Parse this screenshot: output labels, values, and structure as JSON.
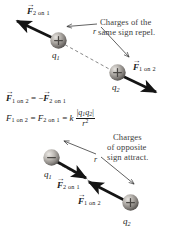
{
  "figure": {
    "background_color": "#ffffff",
    "width": 180,
    "height": 242
  },
  "panels": [
    {
      "id": "repulsion",
      "caption_lines": [
        "Charges of the",
        "same sign repel."
      ],
      "charge_labels": {
        "q1": "q",
        "q1_sub": "1",
        "q2": "q",
        "q2_sub": "2"
      },
      "charge_signs": {
        "q1": "+",
        "q2": "+"
      },
      "distance_label": "r",
      "force_on_1": {
        "symbol": "F",
        "subscript": "2 on 1"
      },
      "force_on_2": {
        "symbol": "F",
        "subscript": "1 on 2"
      }
    },
    {
      "id": "attraction",
      "caption_lines": [
        "Charges",
        "of opposite",
        "sign attract."
      ],
      "charge_labels": {
        "q1": "q",
        "q1_sub": "1",
        "q2": "q",
        "q2_sub": "2"
      },
      "charge_signs": {
        "q1": "−",
        "q2": "+"
      },
      "distance_label": "r",
      "force_on_1": {
        "symbol": "F",
        "subscript": "2 on 1"
      },
      "force_on_2": {
        "symbol": "F",
        "subscript": "1 on 2"
      }
    }
  ],
  "equations": {
    "newton_third_law": {
      "lhs_symbol": "F",
      "lhs_sub": "1 on 2",
      "equals": "=",
      "rhs_sign": "−",
      "rhs_symbol": "F",
      "rhs_sub": "2 on 1"
    },
    "coulomb_law": {
      "lhs_symbol": "F",
      "lhs_sub": "1 on 2",
      "equals1": "=",
      "mid_symbol": "F",
      "mid_sub": "2 on 1",
      "equals2": "=",
      "constant": "k",
      "numerator": "|q₁q₂|",
      "num_abs_open": "|",
      "num_q1": "q",
      "num_q1_sub": "1",
      "num_q2": "q",
      "num_q2_sub": "2",
      "num_abs_close": "|",
      "denominator_base": "r",
      "denominator_exp": "2"
    }
  },
  "colors": {
    "caption_text": "#3c3c3c",
    "label_text": "#1a1a1a",
    "arrow": "#141414",
    "dashed_line": "#555555",
    "sphere_light": "#d8d4cf",
    "sphere_mid": "#8d8a86",
    "sphere_dark": "#5d5a57",
    "border": "#c9c9c9"
  }
}
